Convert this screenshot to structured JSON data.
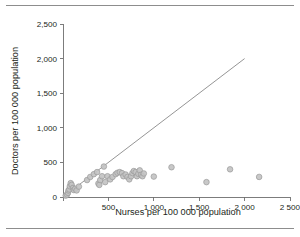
{
  "figure": {
    "top_rule": "horizontal-rule",
    "bottom_rule": "horizontal-rule"
  },
  "chart_data": {
    "type": "scatter",
    "title": "",
    "xlabel": "Nurses per 100 000 population",
    "ylabel": "Doctors per 100 000 population",
    "xlim": [
      0,
      2500
    ],
    "ylim": [
      0,
      2500
    ],
    "grid": false,
    "legend": null,
    "x_ticks": [
      0,
      500,
      1000,
      1500,
      2000,
      2500
    ],
    "x_tick_labels": [
      "",
      "500",
      "1 000",
      "1 500",
      "2 000",
      "2 500"
    ],
    "y_ticks": [
      0,
      500,
      1000,
      1500,
      2000,
      2500
    ],
    "y_tick_labels": [
      "0",
      "500",
      "1,000",
      "1,500",
      "2,000",
      "2,500"
    ],
    "marker": {
      "shape": "circle",
      "fill_color": "#c3c3c3",
      "edge_color": "#9a9a9a",
      "size": 5.6
    },
    "reference_line": {
      "name": "equality-line",
      "from": [
        0,
        0
      ],
      "to": [
        2000,
        2000
      ],
      "color": "#7a7a7a"
    },
    "points": [
      [
        30,
        20
      ],
      [
        45,
        35
      ],
      [
        55,
        60
      ],
      [
        60,
        95
      ],
      [
        70,
        110
      ],
      [
        75,
        155
      ],
      [
        85,
        200
      ],
      [
        95,
        175
      ],
      [
        110,
        130
      ],
      [
        120,
        100
      ],
      [
        135,
        120
      ],
      [
        150,
        95
      ],
      [
        175,
        150
      ],
      [
        265,
        245
      ],
      [
        300,
        290
      ],
      [
        340,
        330
      ],
      [
        375,
        360
      ],
      [
        390,
        195
      ],
      [
        400,
        175
      ],
      [
        410,
        245
      ],
      [
        430,
        300
      ],
      [
        450,
        440
      ],
      [
        465,
        215
      ],
      [
        490,
        300
      ],
      [
        520,
        255
      ],
      [
        545,
        290
      ],
      [
        580,
        330
      ],
      [
        600,
        350
      ],
      [
        625,
        360
      ],
      [
        650,
        345
      ],
      [
        665,
        300
      ],
      [
        690,
        325
      ],
      [
        710,
        290
      ],
      [
        730,
        255
      ],
      [
        750,
        300
      ],
      [
        765,
        345
      ],
      [
        780,
        375
      ],
      [
        800,
        360
      ],
      [
        815,
        300
      ],
      [
        830,
        335
      ],
      [
        845,
        385
      ],
      [
        860,
        320
      ],
      [
        875,
        300
      ],
      [
        890,
        340
      ],
      [
        1000,
        295
      ],
      [
        1195,
        430
      ],
      [
        1580,
        215
      ],
      [
        1840,
        400
      ],
      [
        2160,
        290
      ]
    ]
  }
}
